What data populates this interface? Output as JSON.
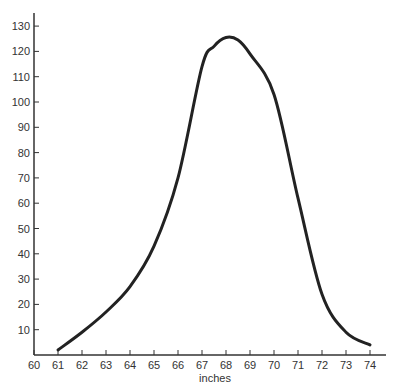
{
  "chart_data": {
    "type": "line",
    "title": "",
    "xlabel": "inches",
    "ylabel": "",
    "x": [
      61,
      62,
      63,
      64,
      65,
      66,
      67,
      67.5,
      68,
      68.5,
      69,
      70,
      71,
      72,
      73,
      74
    ],
    "series": [
      {
        "name": "frequency",
        "values": [
          2,
          9,
          17,
          27,
          43,
          70,
          114,
          122,
          125.5,
          124.5,
          119,
          103,
          62,
          24,
          9,
          4
        ]
      }
    ],
    "xlim": [
      60,
      74
    ],
    "ylim": [
      0,
      135
    ],
    "x_ticks": [
      60,
      61,
      62,
      63,
      64,
      65,
      66,
      67,
      68,
      69,
      70,
      71,
      72,
      73,
      74
    ],
    "y_ticks": [
      10,
      20,
      30,
      40,
      50,
      60,
      70,
      80,
      90,
      100,
      110,
      120,
      130
    ],
    "grid": false,
    "legend": null,
    "line_color": "#222222"
  }
}
